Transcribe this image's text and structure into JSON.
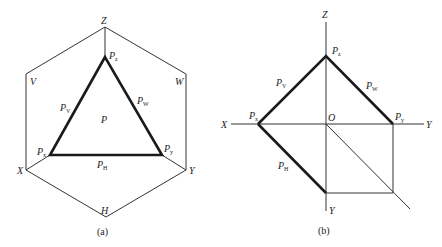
{
  "figure_a": {
    "caption": "(a)",
    "corners": {
      "Z": "Z",
      "V": "V",
      "W": "W",
      "X": "X",
      "Y": "Y",
      "H": "H"
    },
    "plane_label": "P",
    "traces": {
      "Pz": {
        "main": "P",
        "sub": "z"
      },
      "Px": {
        "main": "P",
        "sub": "x"
      },
      "Py": {
        "main": "P",
        "sub": "y"
      },
      "PV": {
        "main": "P",
        "sub": "V"
      },
      "PW": {
        "main": "P",
        "sub": "W"
      },
      "PH": {
        "main": "P",
        "sub": "H"
      }
    }
  },
  "figure_b": {
    "caption": "(b)",
    "axes": {
      "Z": "Z",
      "X": "X",
      "Y_right": "Y",
      "Y_down": "Y",
      "O": "O"
    },
    "traces": {
      "Pz": {
        "main": "P",
        "sub": "z"
      },
      "Px": {
        "main": "P",
        "sub": "x"
      },
      "Py": {
        "main": "P",
        "sub": "y"
      },
      "PV": {
        "main": "P",
        "sub": "V"
      },
      "PW": {
        "main": "P",
        "sub": "W"
      },
      "PH": {
        "main": "P",
        "sub": "H"
      }
    }
  }
}
